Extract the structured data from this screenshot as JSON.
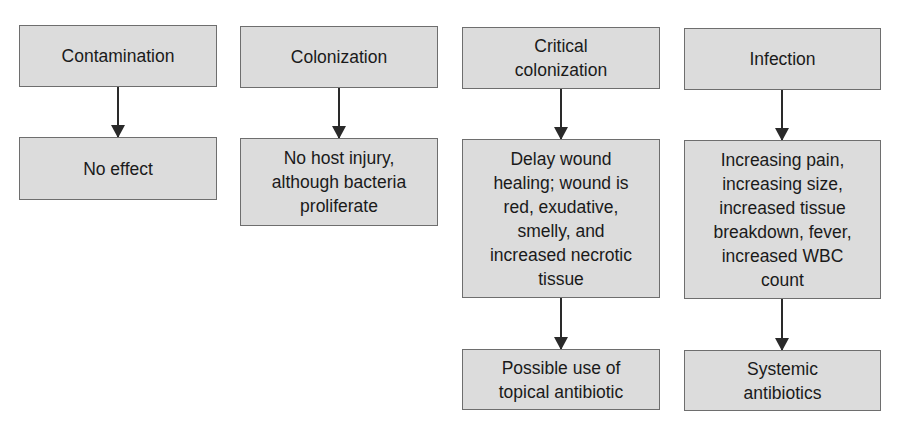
{
  "diagram": {
    "type": "flowchart",
    "columns": [
      {
        "stage": "Contamination",
        "effect": "No effect",
        "treatment": null
      },
      {
        "stage": "Colonization",
        "effect": "No host injury,\nalthough bacteria\nproliferate",
        "treatment": null
      },
      {
        "stage": "Critical\ncolonization",
        "effect": "Delay wound\nhealing; wound is\nred, exudative,\nsmelly, and\nincreased necrotic\ntissue",
        "treatment": "Possible use of\ntopical antibiotic"
      },
      {
        "stage": "Infection",
        "effect": "Increasing pain,\nincreasing size,\nincreased tissue\nbreakdown, fever,\nincreased WBC\ncount",
        "treatment": "Systemic\nantibiotics"
      }
    ],
    "colors": {
      "box_fill": "#dcdcdc",
      "box_border": "#6e6e6e",
      "arrow": "#2a2a2a"
    }
  }
}
